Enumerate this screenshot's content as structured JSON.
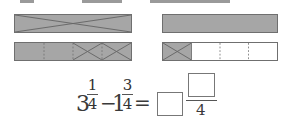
{
  "colors": {
    "shaded": "#a6a6a6",
    "border": "#6f6f6f",
    "cross": "#666666",
    "dashed": "#8a8a8a",
    "empty": "#ffffff"
  },
  "diagram": {
    "left_top_bar": {
      "parts": 1,
      "shaded": true,
      "crossed_out": [
        0
      ]
    },
    "left_bottom_bar": {
      "parts": 4,
      "shaded_parts": [
        0,
        1,
        2,
        3
      ],
      "crossed_out": [
        2,
        3
      ]
    },
    "right_top_bar": {
      "parts": 1,
      "shaded": true,
      "crossed_out": []
    },
    "right_bottom_bar": {
      "parts": 4,
      "shaded_parts": [
        0
      ],
      "crossed_out": [
        0
      ]
    }
  },
  "equation": {
    "term1_whole": "3",
    "term1_num": "1",
    "term1_den": "4",
    "operator": "−",
    "term2_whole": "1",
    "term2_num": "3",
    "term2_den": "4",
    "equals": "=",
    "answer_whole": "",
    "answer_num": "",
    "answer_den": "4"
  }
}
